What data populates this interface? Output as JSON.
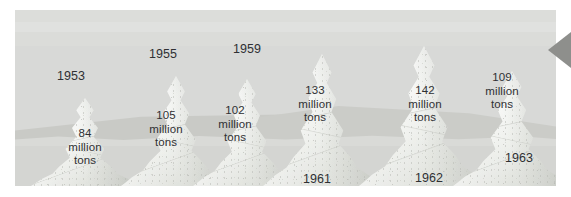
{
  "figure": {
    "kind": "pictorial-bar-chart",
    "unit_label": "million tons",
    "background_color": "#d8d9d7",
    "ground_color": "#d4d5d2",
    "mountain_color": "#edeeeb",
    "text_color": "#2f3033",
    "pointer_color": "#8e8f8c"
  },
  "pointer": {
    "icon": "left-triangle-pointer-icon"
  },
  "chart_data": {
    "type": "bar",
    "title": "",
    "subtitle": "",
    "xlabel": "",
    "ylabel": "",
    "unit": "million tons",
    "grid": false,
    "legend": "none",
    "categories": [
      "1953",
      "1955",
      "1959",
      "1961",
      "1962",
      "1963"
    ],
    "values": [
      84,
      105,
      102,
      133,
      142,
      109
    ],
    "ylim": [
      0,
      150
    ],
    "value_labels": [
      "84\nmillion\ntons",
      "105\nmillion\ntons",
      "102\nmillion\ntons",
      "133\nmillion\ntons",
      "142\nmillion\ntons",
      "109\nmillion\ntons"
    ],
    "tick_labels": [
      "1953",
      "1955",
      "1959",
      "1961",
      "1962",
      "1963"
    ]
  },
  "peaks": [
    {
      "year": "1953",
      "amount": "84\nmillion\ntons",
      "value": 84,
      "year_pos": {
        "x": 26,
        "y": 59
      },
      "amount_pos": {
        "x": 38,
        "y": 117
      },
      "shape": {
        "left": 16,
        "width": 108,
        "height": 88
      }
    },
    {
      "year": "1955",
      "amount": "105\nmillion\ntons",
      "value": 105,
      "year_pos": {
        "x": 118,
        "y": 37
      },
      "amount_pos": {
        "x": 119,
        "y": 99
      },
      "shape": {
        "left": 106,
        "width": 110,
        "height": 110
      }
    },
    {
      "year": "1959",
      "amount": "102\nmillion\ntons",
      "value": 102,
      "year_pos": {
        "x": 202,
        "y": 32
      },
      "amount_pos": {
        "x": 188,
        "y": 94
      },
      "shape": {
        "left": 178,
        "width": 108,
        "height": 107
      }
    },
    {
      "year": "1961",
      "amount": "133\nmillion\ntons",
      "value": 133,
      "year_pos": {
        "x": 272,
        "y": 162
      },
      "amount_pos": {
        "x": 268,
        "y": 74
      },
      "shape": {
        "left": 248,
        "width": 118,
        "height": 132
      }
    },
    {
      "year": "1962",
      "amount": "142\nmillion\ntons",
      "value": 142,
      "year_pos": {
        "x": 384,
        "y": 161
      },
      "amount_pos": {
        "x": 378,
        "y": 74
      },
      "shape": {
        "left": 344,
        "width": 130,
        "height": 140
      }
    },
    {
      "year": "1963",
      "amount": "109\nmillion\ntons",
      "value": 109,
      "year_pos": {
        "x": 474,
        "y": 141
      },
      "amount_pos": {
        "x": 455,
        "y": 61
      },
      "shape": {
        "left": 438,
        "width": 118,
        "height": 115
      }
    }
  ]
}
